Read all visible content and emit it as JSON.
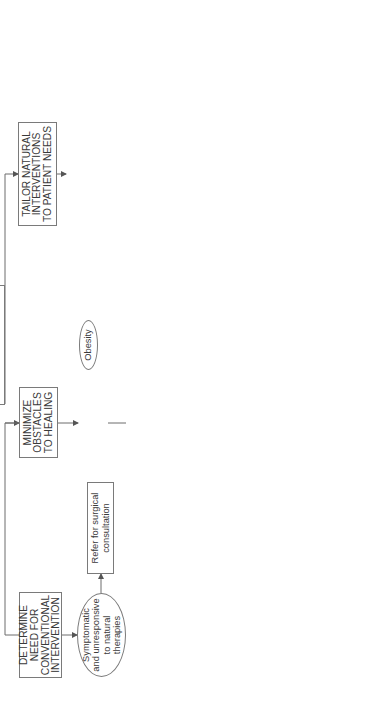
{
  "diagram": {
    "orientation": "rotated-90-ccw",
    "stages": [
      {
        "id": "determine",
        "label": "DETERMINE\nNEED FOR\nCONVENTIONAL\nINTERVENTION"
      },
      {
        "id": "minimize",
        "label": "MINIMIZE\nOBSTACLES\nTO HEALING"
      },
      {
        "id": "tailor",
        "label": "TAILOR NATURAL\nINTERVENTIONS\nTO PATIENT NEEDS"
      }
    ],
    "determine_branch": {
      "condition": "Symptomatic\nand unresponsive\nto natural\ntherapies",
      "action": "Refer for surgical\nconsultation"
    },
    "minimize_branch": [
      {
        "condition": "Obesity",
        "action": "Carefully monitored weight\nmanagement program\nIncrease bile solubility"
      },
      {
        "condition": "Exogenous\nestrogens or\nlipid-lowering\ndrugs",
        "action": "Cease oral contraceptives\nSubstitute natural therapies\nfor hyperlipidemia"
      },
      {
        "condition": "Alcohol liver\nabuse",
        "action": "Alcohol abuse\nrehabilitation program"
      },
      {
        "condition": "Avoid foods\nthat exacerbate\nsymptoms",
        "action": "Eliminate food allergens\nand fried foods\nReduce saturated fats,\nsimple sugars, coffee\nLimit legumes"
      },
      {
        "condition": "Increase water-\nsoluble fiber",
        "action": "Increase vegetables\nand fruits\nSubstitute soy protein for\nanimal protein (casein)\nMilled flaxseed, chia seed,\nbuckwheat"
      },
      {
        "condition": "Control lifestyle\nissues that\nincrease risk",
        "action": "Implement stress\nmanagement as needed"
      }
    ],
    "tailor_branch": [
      {
        "goal": "Increase\nwater content\nof bile",
        "action": "8 oz pure water every\nwaking hour"
      },
      {
        "goal": "Correct\ncontributing\nnutritional\ndeficiencies",
        "action": "Vitamins C and E"
      },
      {
        "goal": "Increase\nbile flow\nfrom liver",
        "action_lines": {
          "l1": "Lipotropic factors:",
          "l2": "Choline, methionine",
          "l3": "Choose one botanical:",
          "b1": "Taraxacum",
          "b2": "Peumus",
          "b3": "Silybum",
          "b4": "Cynara",
          "b5": "Curcuma"
        }
      },
      {
        "goal": "Increase\nphospholipid\ncontent of bile",
        "action": "Phosphatidylcholine\nFish oil"
      },
      {
        "goal": "Optimize\ncholesterol\nexcretion",
        "action": "Water-soluble,\ngel-forming\nfiber sources"
      },
      {
        "goal": "Dissolve\ngallstones",
        "action": "Plant terpene complex\nUrsodeoxycholic acid"
      }
    ],
    "colors": {
      "line": "#6d6d6d",
      "border": "#7a7a7a",
      "text": "#3a3a3a",
      "background": "#ffffff"
    }
  }
}
